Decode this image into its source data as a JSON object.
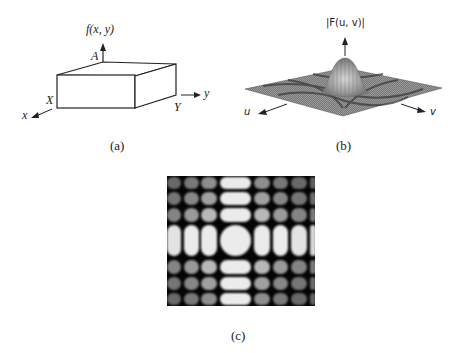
{
  "figure": {
    "panel_a": {
      "caption": "(a)",
      "function_label": "f(x, y)",
      "height_label": "A",
      "x_extent_label": "X",
      "y_extent_label": "Y",
      "x_axis_label": "x",
      "y_axis_label": "y"
    },
    "panel_b": {
      "caption": "(b)",
      "magnitude_label": "|F(u, v)|",
      "u_axis_label": "u",
      "v_axis_label": "v"
    },
    "panel_c": {
      "caption": "(c)",
      "grid_columns": 7,
      "grid_rows": 7
    }
  }
}
